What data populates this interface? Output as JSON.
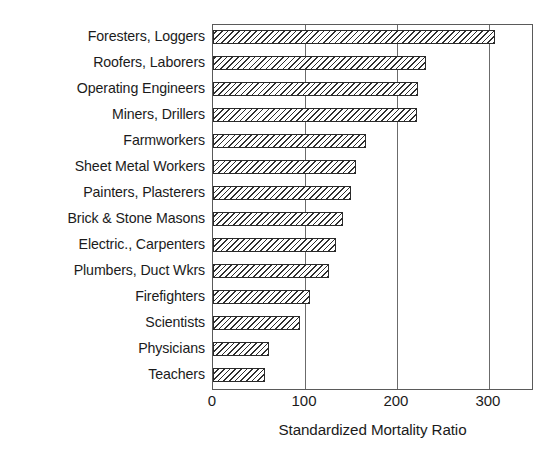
{
  "chart_data": {
    "type": "bar",
    "orientation": "horizontal",
    "title": "",
    "xlabel": "Standardized Mortality Ratio",
    "ylabel": "",
    "xlim": [
      0,
      349
    ],
    "xticks": [
      0,
      100,
      200,
      300
    ],
    "xticklabels": [
      "0",
      "100",
      "200",
      "300"
    ],
    "grid": "vertical",
    "legend": "none",
    "categories": [
      "Foresters, Loggers",
      "Roofers, Laborers",
      "Operating Engineers",
      "Miners, Drillers",
      "Farmworkers",
      "Sheet Metal Workers",
      "Painters, Plasterers",
      "Brick & Stone Masons",
      "Electric., Carpenters",
      "Plumbers, Duct Wkrs",
      "Firefighters",
      "Scientists",
      "Physicians",
      "Teachers"
    ],
    "values": [
      307,
      232,
      223,
      222,
      166,
      155,
      150,
      141,
      134,
      126,
      106,
      95,
      61,
      57
    ],
    "bar_fill": "#ffffff",
    "bar_edge": "#2a2a2a",
    "bar_hatch": "diagonal-lines",
    "axis_color": "#5a5a5a",
    "grid_color": "#6b6b6b",
    "text_color": "#1b1b1b",
    "background": "#ffffff"
  }
}
